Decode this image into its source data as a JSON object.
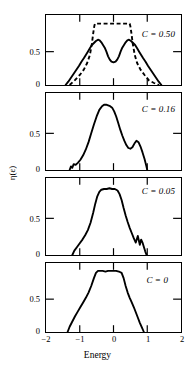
{
  "chart_data": {
    "type": "line",
    "title": "",
    "xlabel": "Energy",
    "ylabel": "η(ε)",
    "xlim": [
      -2,
      2
    ],
    "ylim": [
      0,
      1.05
    ],
    "xticks": [
      -2,
      -1,
      0,
      1,
      2
    ],
    "xtick_labels": [
      "−2",
      "−1",
      "0",
      "1",
      "2"
    ],
    "yticks": [
      0,
      0.5
    ],
    "ytick_labels": [
      "0",
      "0.5"
    ],
    "grid": false,
    "legend_position": "inside-right",
    "panels": [
      {
        "id": "panel-c050",
        "annotation": "C = 0.50",
        "annotation_symbol": "C",
        "annotation_value": "0.50",
        "series": [
          {
            "name": "solid",
            "style": "solid",
            "x": [
              -1.42,
              -1.34,
              -1.26,
              -1.18,
              -1.1,
              -1.02,
              -0.95,
              -0.88,
              -0.82,
              -0.76,
              -0.7,
              -0.64,
              -0.58,
              -0.52,
              -0.46,
              -0.41,
              -0.36,
              -0.31,
              -0.26,
              -0.21,
              -0.16,
              -0.11,
              -0.06,
              0.0,
              0.06,
              0.11,
              0.16,
              0.21,
              0.26,
              0.31,
              0.36,
              0.41,
              0.46,
              0.52,
              0.58,
              0.64,
              0.7,
              0.76,
              0.82,
              0.88,
              0.95,
              1.02,
              1.1,
              1.18,
              1.26,
              1.34,
              1.42
            ],
            "y": [
              0.0,
              0.05,
              0.11,
              0.17,
              0.23,
              0.29,
              0.35,
              0.4,
              0.45,
              0.5,
              0.55,
              0.6,
              0.63,
              0.66,
              0.68,
              0.67,
              0.64,
              0.6,
              0.56,
              0.5,
              0.43,
              0.38,
              0.35,
              0.34,
              0.35,
              0.38,
              0.43,
              0.5,
              0.56,
              0.6,
              0.64,
              0.67,
              0.68,
              0.66,
              0.63,
              0.6,
              0.55,
              0.5,
              0.45,
              0.4,
              0.35,
              0.29,
              0.23,
              0.17,
              0.11,
              0.05,
              0.0
            ]
          },
          {
            "name": "dashed",
            "style": "dashed",
            "x": [
              -1.3,
              -1.15,
              -1.0,
              -0.88,
              -0.78,
              -0.7,
              -0.64,
              -0.6,
              -0.57,
              -0.55,
              -0.3,
              0.0,
              0.28,
              0.48,
              0.5,
              0.53,
              0.57,
              0.63,
              0.7,
              0.8,
              0.92,
              1.05,
              1.2,
              1.35
            ],
            "y": [
              0.0,
              0.07,
              0.15,
              0.23,
              0.33,
              0.45,
              0.62,
              0.78,
              0.88,
              0.92,
              0.92,
              0.92,
              0.92,
              0.92,
              0.88,
              0.78,
              0.62,
              0.45,
              0.33,
              0.23,
              0.15,
              0.07,
              0.03,
              0.0
            ]
          }
        ]
      },
      {
        "id": "panel-c016",
        "annotation": "C = 0.16",
        "annotation_symbol": "C",
        "annotation_value": "0.16",
        "series": [
          {
            "name": "solid",
            "style": "solid",
            "x": [
              -1.3,
              -1.26,
              -1.22,
              -1.18,
              -1.12,
              -1.05,
              -0.98,
              -0.9,
              -0.82,
              -0.74,
              -0.66,
              -0.58,
              -0.5,
              -0.42,
              -0.34,
              -0.28,
              -0.22,
              -0.16,
              -0.1,
              -0.04,
              0.02,
              0.08,
              0.14,
              0.2,
              0.26,
              0.32,
              0.38,
              0.44,
              0.5,
              0.56,
              0.62,
              0.68,
              0.74,
              0.8,
              0.86,
              0.92,
              0.97,
              1.0
            ],
            "y": [
              0.0,
              0.05,
              0.03,
              0.08,
              0.07,
              0.1,
              0.14,
              0.2,
              0.28,
              0.38,
              0.5,
              0.62,
              0.73,
              0.82,
              0.87,
              0.89,
              0.89,
              0.88,
              0.87,
              0.85,
              0.8,
              0.73,
              0.64,
              0.55,
              0.47,
              0.4,
              0.34,
              0.3,
              0.29,
              0.31,
              0.36,
              0.4,
              0.38,
              0.32,
              0.24,
              0.15,
              0.06,
              0.0
            ]
          }
        ]
      },
      {
        "id": "panel-c005",
        "annotation": "C = 0.05",
        "annotation_symbol": "C",
        "annotation_value": "0.05",
        "series": [
          {
            "name": "solid",
            "style": "solid",
            "x": [
              -1.22,
              -1.16,
              -1.08,
              -1.0,
              -0.92,
              -0.84,
              -0.76,
              -0.68,
              -0.6,
              -0.54,
              -0.48,
              -0.42,
              -0.36,
              -0.28,
              -0.2,
              -0.12,
              -0.04,
              0.04,
              0.12,
              0.18,
              0.24,
              0.3,
              0.36,
              0.42,
              0.48,
              0.54,
              0.6,
              0.66,
              0.72,
              0.78,
              0.82,
              0.86,
              0.9,
              0.94,
              0.98
            ],
            "y": [
              0.0,
              0.06,
              0.11,
              0.16,
              0.21,
              0.27,
              0.34,
              0.44,
              0.58,
              0.7,
              0.8,
              0.86,
              0.89,
              0.9,
              0.9,
              0.91,
              0.9,
              0.9,
              0.88,
              0.83,
              0.75,
              0.64,
              0.54,
              0.45,
              0.37,
              0.3,
              0.23,
              0.17,
              0.26,
              0.14,
              0.21,
              0.17,
              0.11,
              0.05,
              0.0
            ]
          }
        ]
      },
      {
        "id": "panel-c0",
        "annotation": "C = 0",
        "annotation_symbol": "C",
        "annotation_value": "0",
        "series": [
          {
            "name": "solid",
            "style": "solid",
            "x": [
              -1.36,
              -1.3,
              -1.22,
              -1.14,
              -1.06,
              -0.98,
              -0.9,
              -0.82,
              -0.74,
              -0.66,
              -0.58,
              -0.52,
              -0.46,
              -0.4,
              -0.32,
              -0.24,
              -0.16,
              -0.08,
              0.0,
              0.08,
              0.16,
              0.24,
              0.3,
              0.36,
              0.42,
              0.48,
              0.54,
              0.6,
              0.66,
              0.72,
              0.78,
              0.84,
              0.9
            ],
            "y": [
              0.0,
              0.08,
              0.16,
              0.24,
              0.31,
              0.38,
              0.45,
              0.52,
              0.6,
              0.7,
              0.82,
              0.9,
              0.93,
              0.93,
              0.93,
              0.92,
              0.93,
              0.93,
              0.93,
              0.93,
              0.92,
              0.9,
              0.82,
              0.7,
              0.6,
              0.52,
              0.45,
              0.38,
              0.3,
              0.22,
              0.14,
              0.07,
              0.0
            ]
          }
        ]
      }
    ]
  },
  "axes": {
    "ylabel": "η(ε)",
    "xlabel": "Energy",
    "ytick_0": "0",
    "ytick_05": "0.5",
    "xtick_m2": "−2",
    "xtick_m1": "−1",
    "xtick_0": "0",
    "xtick_1": "1",
    "xtick_2": "2"
  }
}
